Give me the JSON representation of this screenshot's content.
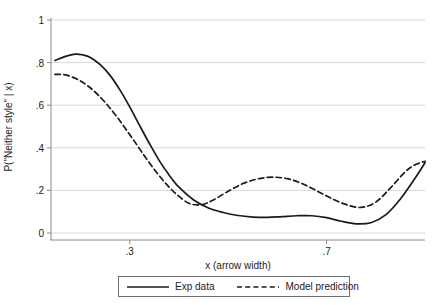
{
  "chart_data": {
    "type": "line",
    "title": "",
    "xlabel": "x (arrow width)",
    "ylabel": "P(\"Neither style\" | x)",
    "xlim": [
      0.14,
      0.9
    ],
    "ylim": [
      0,
      1
    ],
    "xticks": [
      0.3,
      0.7
    ],
    "xtick_labels": [
      ".3",
      ".7"
    ],
    "yticks": [
      0,
      0.2,
      0.4,
      0.6,
      0.8,
      1
    ],
    "ytick_labels": [
      "0",
      ".2",
      ".4",
      ".6",
      ".8",
      "1"
    ],
    "grid": "horizontal",
    "legend_position": "bottom-outside",
    "series": [
      {
        "name": "Exp data",
        "style": "solid",
        "color": "#1a1a1a",
        "x": [
          0.148,
          0.168,
          0.19,
          0.205,
          0.22,
          0.24,
          0.26,
          0.28,
          0.3,
          0.32,
          0.34,
          0.36,
          0.38,
          0.4,
          0.43,
          0.46,
          0.49,
          0.52,
          0.55,
          0.58,
          0.61,
          0.64,
          0.67,
          0.7,
          0.73,
          0.76,
          0.79,
          0.82,
          0.85,
          0.88,
          0.9
        ],
        "y": [
          0.81,
          0.828,
          0.84,
          0.836,
          0.824,
          0.79,
          0.74,
          0.672,
          0.592,
          0.505,
          0.42,
          0.34,
          0.272,
          0.215,
          0.155,
          0.117,
          0.096,
          0.082,
          0.075,
          0.073,
          0.077,
          0.081,
          0.081,
          0.072,
          0.055,
          0.043,
          0.048,
          0.085,
          0.16,
          0.258,
          0.33
        ]
      },
      {
        "name": "Model prediction",
        "style": "dashed",
        "color": "#1a1a1a",
        "x": [
          0.148,
          0.17,
          0.195,
          0.215,
          0.235,
          0.255,
          0.275,
          0.295,
          0.315,
          0.335,
          0.355,
          0.375,
          0.395,
          0.42,
          0.445,
          0.47,
          0.5,
          0.53,
          0.56,
          0.59,
          0.62,
          0.65,
          0.68,
          0.71,
          0.74,
          0.77,
          0.8,
          0.83,
          0.86,
          0.88,
          0.9
        ],
        "y": [
          0.745,
          0.742,
          0.72,
          0.69,
          0.65,
          0.6,
          0.542,
          0.478,
          0.412,
          0.345,
          0.283,
          0.228,
          0.182,
          0.14,
          0.133,
          0.155,
          0.196,
          0.232,
          0.254,
          0.262,
          0.255,
          0.232,
          0.198,
          0.162,
          0.133,
          0.12,
          0.145,
          0.212,
          0.288,
          0.32,
          0.337
        ]
      }
    ]
  },
  "legend": {
    "entries": [
      {
        "label": "Exp data",
        "style": "solid"
      },
      {
        "label": "Model prediction",
        "style": "dashed"
      }
    ]
  }
}
